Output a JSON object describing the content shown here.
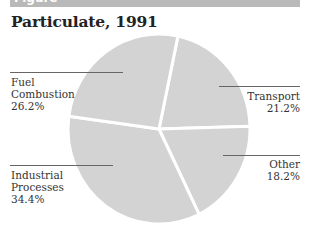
{
  "header": {
    "figure_label": "Figure"
  },
  "chart_data": {
    "type": "pie",
    "title": "Particulate, 1991",
    "slices": [
      {
        "label": "Transport",
        "value": 21.2,
        "display": "21.2%"
      },
      {
        "label": "Other",
        "value": 18.2,
        "display": "18.2%"
      },
      {
        "label": "Industrial Processes",
        "value": 34.4,
        "display": "34.4%"
      },
      {
        "label": "Fuel Combustion",
        "value": 26.2,
        "display": "26.2%"
      }
    ],
    "colors": {
      "slice": "#d3d3d3",
      "separator": "#ffffff",
      "leader": "#666666",
      "header_bar": "#b9b9b9"
    },
    "legend": "none (direct labels with leader lines)"
  },
  "labels": {
    "fuel": {
      "line1": "Fuel",
      "line2": "Combustion",
      "pct": "26.2%"
    },
    "transport": {
      "line1": "Transport",
      "pct": "21.2%"
    },
    "industrial": {
      "line1": "Industrial",
      "line2": "Processes",
      "pct": "34.4%"
    },
    "other": {
      "line1": "Other",
      "pct": "18.2%"
    }
  }
}
